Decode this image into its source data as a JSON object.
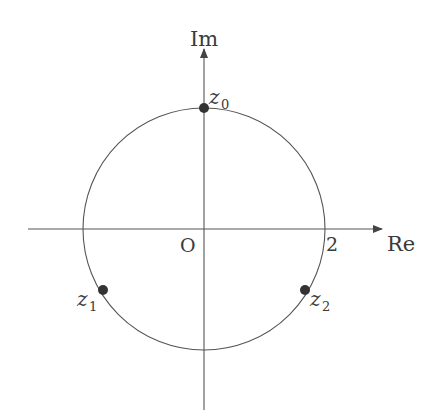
{
  "diagram": {
    "type": "complex-plane",
    "axes": {
      "x_label": "Re",
      "y_label": "Im",
      "origin_label": "O",
      "tick_label": "2"
    },
    "circle": {
      "center": [
        0,
        0
      ],
      "radius": 2
    },
    "points": [
      {
        "name": "z",
        "sub": "0",
        "angle_deg": 90
      },
      {
        "name": "z",
        "sub": "1",
        "angle_deg": 210
      },
      {
        "name": "z",
        "sub": "2",
        "angle_deg": 330
      }
    ],
    "colors": {
      "line": "#444444",
      "point": "#333333",
      "text": "#3a3a3a"
    }
  }
}
